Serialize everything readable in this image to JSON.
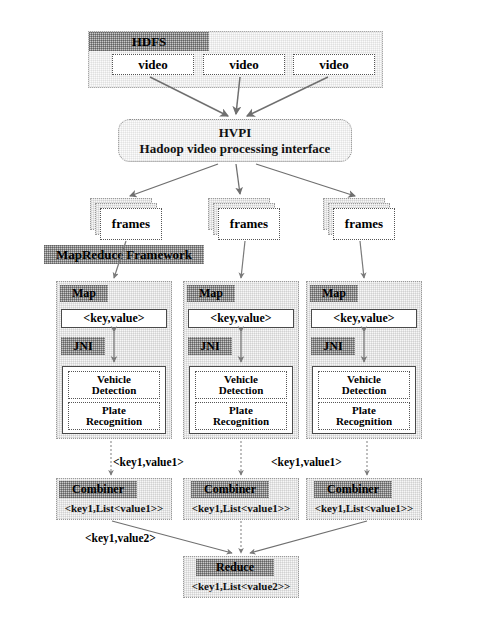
{
  "diagram": {
    "hdfs": {
      "label": "HDFS",
      "videos": [
        "video",
        "video",
        "video"
      ]
    },
    "hvpi": {
      "line1": "HVPI",
      "line2": "Hadoop video processing interface"
    },
    "frames": [
      "frames",
      "frames",
      "frames"
    ],
    "framework": {
      "label": "MapReduce Framework"
    },
    "maps": [
      {
        "label": "Map",
        "key_value": "<key,value>",
        "jni": "JNI",
        "tasks": [
          "Vehicle\nDetection",
          "Plate\nRecognition"
        ],
        "task1_line1": "Vehicle",
        "task1_line2": "Detection",
        "task2_line1": "Plate",
        "task2_line2": "Recognition"
      },
      {
        "label": "Map",
        "key_value": "<key,value>",
        "jni": "JNI",
        "task1_line1": "Vehicle",
        "task1_line2": "Detection",
        "task2_line1": "Plate",
        "task2_line2": "Recognition"
      },
      {
        "label": "Map",
        "key_value": "<key,value>",
        "jni": "JNI",
        "task1_line1": "Vehicle",
        "task1_line2": "Detection",
        "task2_line1": "Plate",
        "task2_line2": "Recognition"
      }
    ],
    "combiners": [
      {
        "label": "Combiner",
        "output": "<key1,List<value1>>"
      },
      {
        "label": "Combiner",
        "output": "<key1,List<value1>>"
      },
      {
        "label": "Combiner",
        "output": "<key1,List<value1>>"
      }
    ],
    "reduce": {
      "label": "Reduce",
      "output": "<key1,List<value2>>"
    },
    "edge_labels": {
      "map_to_combiner_left": "<key1,value1>",
      "map_to_combiner_right": "<key1,value1>",
      "combiner_to_reduce": "<key1,value2>"
    },
    "colors": {
      "header_bar": "#c9c9c9",
      "panel_fill": "#fbfbfb",
      "box_stroke": "#4a4a4a",
      "arrow": "#6b6b6b",
      "text": "#111111"
    }
  }
}
